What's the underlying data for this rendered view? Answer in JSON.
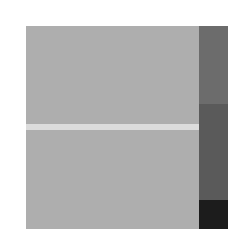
{
  "image": {
    "description": "Grayscale abstract composition: large gray square with a thin light horizontal band and a vertical dark strip of three shades on the right",
    "colors": {
      "background": "#ffffff",
      "panel": "#aeaeae",
      "band": "#dcdcdc",
      "strip_top": "#6c6c6c",
      "strip_middle": "#5a5a5a",
      "strip_bottom": "#1c1c1c"
    }
  }
}
